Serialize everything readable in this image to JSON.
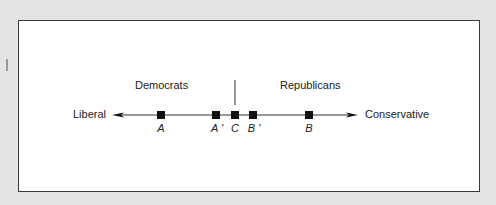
{
  "diagram": {
    "axis": {
      "left_label": "Liberal",
      "right_label": "Conservative"
    },
    "groups": {
      "left": "Democrats",
      "right": "Republicans"
    },
    "points": [
      {
        "label": "A",
        "x": 161
      },
      {
        "label": "A '",
        "x": 216
      },
      {
        "label": "C",
        "x": 235
      },
      {
        "label": "B '",
        "x": 253
      },
      {
        "label": "B",
        "x": 309
      }
    ],
    "colors": {
      "background": "#e4e4e2",
      "panel": "#ffffff",
      "ink": "#111111"
    }
  }
}
